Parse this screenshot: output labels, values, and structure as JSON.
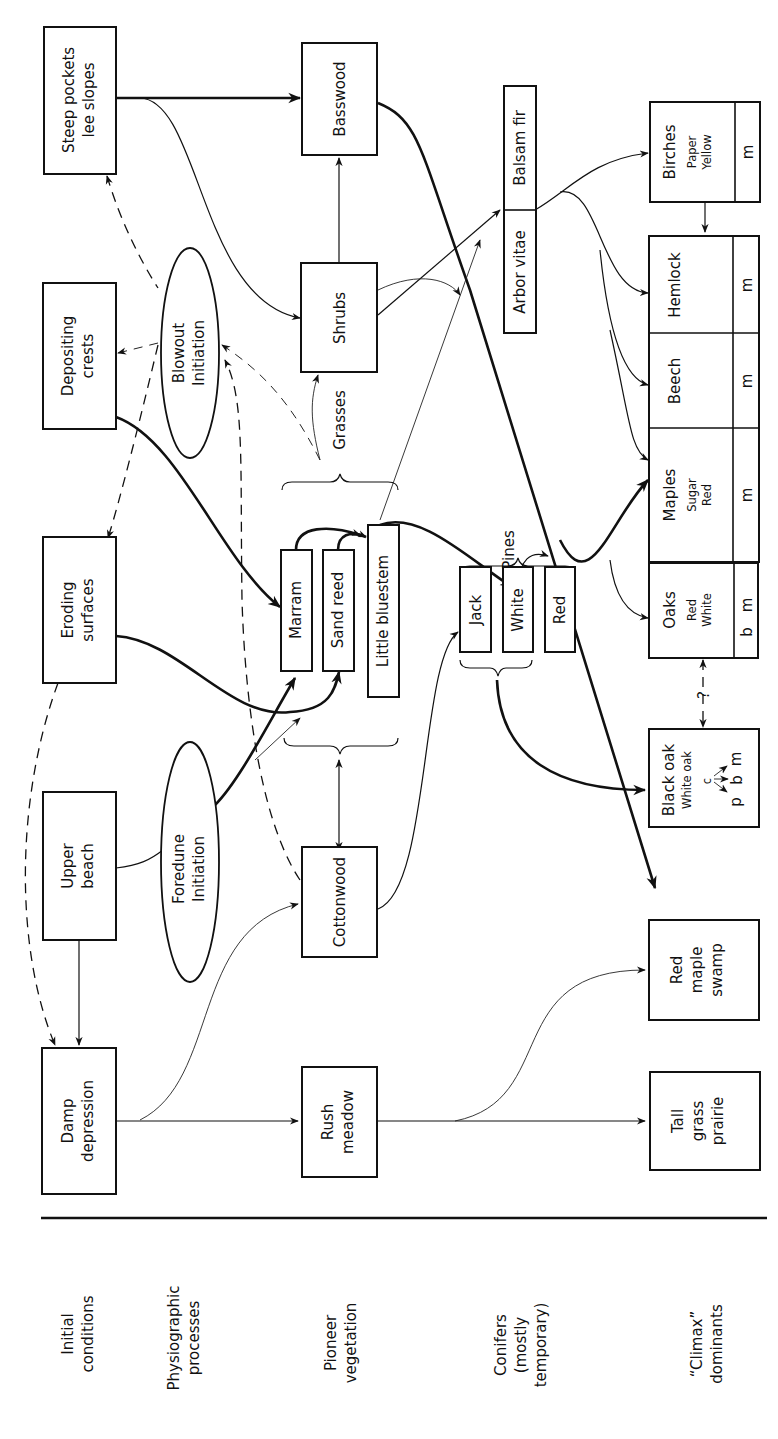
{
  "row_labels": [
    {
      "line1": "Initial",
      "line2": "conditions",
      "line3": ""
    },
    {
      "line1": "Physiographic",
      "line2": "processes",
      "line3": ""
    },
    {
      "line1": "Pioneer",
      "line2": "vegetation",
      "line3": ""
    },
    {
      "line1": "Conifers",
      "line2": "(mostly",
      "line3": "temporary)"
    },
    {
      "line1": "“Climax”",
      "line2": "dominants",
      "line3": ""
    }
  ],
  "initial_conditions": {
    "steep_pockets": {
      "line1": "Steep pockets",
      "line2": "lee slopes"
    },
    "depositing_crests": {
      "line1": "Depositing",
      "line2": "crests"
    },
    "eroding_surfaces": {
      "line1": "Eroding",
      "line2": "surfaces"
    },
    "upper_beach": {
      "line1": "Upper",
      "line2": "beach"
    },
    "damp_depression": {
      "line1": "Damp",
      "line2": "depression"
    }
  },
  "processes": {
    "blowout": {
      "line1": "Blowout",
      "line2": "Initiation"
    },
    "foredune": {
      "line1": "Foredune",
      "line2": "Initiation"
    }
  },
  "pioneer": {
    "basswood": "Basswood",
    "shrubs": "Shrubs",
    "grasses_label": "Grasses",
    "marram": "Marram",
    "sand_reed": "Sand reed",
    "little_bluestem": "Little bluestem",
    "cottonwood": "Cottonwood",
    "rush_meadow": {
      "line1": "Rush",
      "line2": "meadow"
    }
  },
  "conifers": {
    "arbor_vitae": "Arbor vitae",
    "balsam_fir": "Balsam fir",
    "pines_label": "Pines",
    "jack": "Jack",
    "white": "White",
    "red": "Red"
  },
  "climax": {
    "birches": {
      "name": "Birches",
      "sub1": "Paper",
      "sub2": "Yellow",
      "code": "m"
    },
    "hemlock": {
      "name": "Hemlock",
      "code": "m"
    },
    "beech": {
      "name": "Beech",
      "code": "m"
    },
    "maples": {
      "name": "Maples",
      "sub1": "Sugar",
      "sub2": "Red",
      "code": "m"
    },
    "oaks": {
      "name": "Oaks",
      "sub1": "Red",
      "sub2": "White",
      "code_b": "b",
      "code_m": "m"
    },
    "black_oak": {
      "name": "Black oak",
      "sub": "White oak",
      "c": "c",
      "p": "p",
      "b": "b",
      "m": "m"
    },
    "question": "?",
    "red_maple_swamp": {
      "line1": "Red",
      "line2": "maple",
      "line3": "swamp"
    },
    "tall_grass_prairie": {
      "line1": "Tall",
      "line2": "grass",
      "line3": "prairie"
    }
  }
}
